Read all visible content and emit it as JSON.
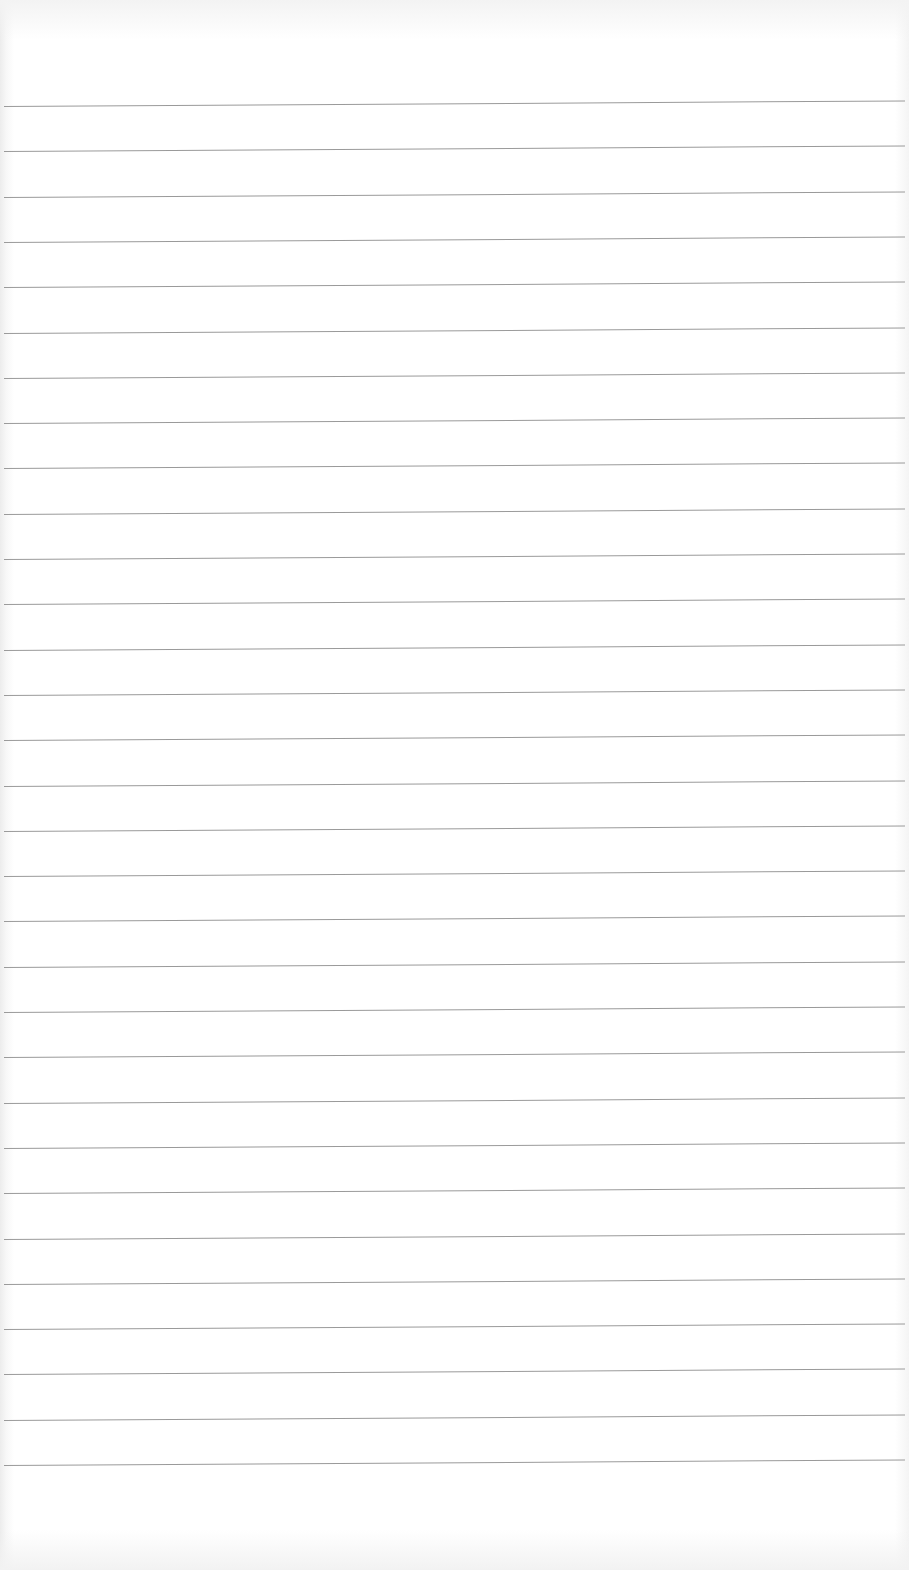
{
  "page": {
    "type": "lined-paper",
    "background_color": "#ffffff",
    "rule_color": "#9a9a9a",
    "rule_count": 31,
    "first_rule_y": 106,
    "rule_spacing": 45.3,
    "rule_tilt_deg": -0.35
  }
}
